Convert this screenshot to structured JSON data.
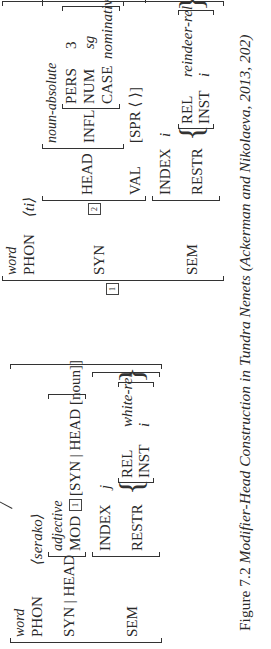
{
  "figure": {
    "caption_label": "Figure 7.2",
    "caption_text": "Modifier-Head Construction in Tundra Nenets (Ackerman and Nikolaeva, 2013, 202)"
  },
  "avm_modifier": {
    "type": "word",
    "phon_label": "PHON",
    "phon_value": "⟨serako⟩",
    "syn_head_label": "SYN | HEAD",
    "head_type": "adjective",
    "mod_label": "MOD",
    "mod_tag": "1",
    "mod_value": "[SYN | HEAD [noun]]",
    "sem_label": "SEM",
    "index_label": "INDEX",
    "index_value": "j",
    "restr_label": "RESTR",
    "rel_label": "REL",
    "rel_value": "white-rel",
    "inst_label": "INST",
    "inst_value": "i"
  },
  "avm_head": {
    "outer_tag": "1",
    "type": "word",
    "phon_label": "PHON",
    "phon_value": "⟨ti⟩",
    "syn_label": "SYN",
    "syn_tag": "2",
    "head_label": "HEAD",
    "head_type": "noun-absolute",
    "infl_label": "INFL",
    "pers_label": "PERS",
    "pers_value": "3",
    "num_label": "NUM",
    "num_value": "sg",
    "case_label": "CASE",
    "case_value": "nominative",
    "val_label": "VAL",
    "spr_value": "[SPR ⟨ ⟩]",
    "sem_label": "SEM",
    "index_label": "INDEX",
    "index_value": "i",
    "restr_label": "RESTR",
    "rel_label": "REL",
    "rel_value": "reindeer-rel",
    "inst_label": "INST",
    "inst_value": "i"
  }
}
